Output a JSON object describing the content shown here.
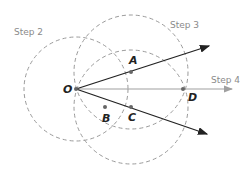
{
  "diagram": {
    "steps": [
      {
        "label": "Step 2",
        "x": 14,
        "y": 35
      },
      {
        "label": "Step 3",
        "x": 170,
        "y": 28
      },
      {
        "label": "Step 4",
        "x": 211,
        "y": 83
      }
    ],
    "points": [
      {
        "label": "O",
        "x": 76,
        "y": 89,
        "lx": 63,
        "ly": 93
      },
      {
        "label": "A",
        "x": 131,
        "y": 72,
        "lx": 129,
        "ly": 64
      },
      {
        "label": "B",
        "x": 105,
        "y": 107,
        "lx": 102,
        "ly": 122
      },
      {
        "label": "C",
        "x": 131,
        "y": 107,
        "lx": 128,
        "ly": 121
      },
      {
        "label": "D",
        "x": 183,
        "y": 89,
        "lx": 188,
        "ly": 101
      }
    ],
    "colors": {
      "ray": "#222222",
      "bisector": "#a0a0a0",
      "dashed": "#9a9a9a",
      "label": "#8a8a8a"
    }
  }
}
